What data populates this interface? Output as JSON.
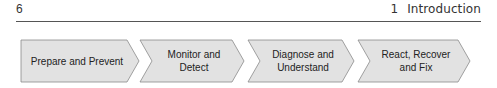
{
  "header": {
    "page_number": "6",
    "chapter_number": "1",
    "chapter_title": "Introduction"
  },
  "process_flow": {
    "fill_color": "#e2e2e2",
    "stroke_color": "#8a8a8a",
    "steps": [
      {
        "label": "Prepare and Prevent"
      },
      {
        "label": "Monitor and\nDetect"
      },
      {
        "label": "Diagnose and\nUnderstand"
      },
      {
        "label": "React, Recover\nand Fix"
      }
    ]
  }
}
